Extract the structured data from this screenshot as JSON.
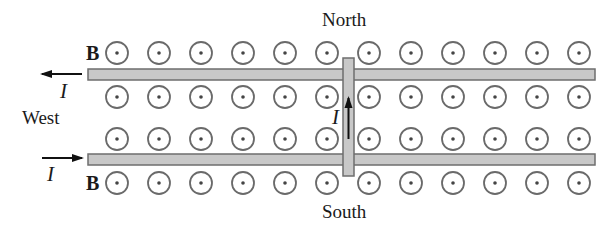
{
  "labels": {
    "north": "North",
    "south": "South",
    "west": "West",
    "field_top": "B",
    "field_bottom": "B",
    "current_top": "I",
    "current_bottom": "I",
    "current_bar": "I"
  },
  "field": {
    "symbol": "out-of-page-dot-circle",
    "columns_x": [
      117,
      159,
      201,
      243,
      285,
      327,
      369,
      411,
      453,
      495,
      537,
      579
    ],
    "rows_y": [
      53,
      97,
      139,
      183
    ],
    "radius": 11
  },
  "rails": [
    {
      "name": "top-rail",
      "x1": 88,
      "x2": 595,
      "y": 69,
      "h": 11,
      "current_direction": "west"
    },
    {
      "name": "bottom-rail",
      "x1": 88,
      "x2": 595,
      "y": 154,
      "h": 11,
      "current_direction": "east"
    }
  ],
  "bar": {
    "x": 343,
    "y": 58,
    "w": 11,
    "h": 118,
    "current_direction": "north"
  },
  "colors": {
    "rail_fill": "#c8c8c8",
    "rail_stroke": "#6e6e6e",
    "circle_stroke": "#6a6a6a",
    "arrow": "#111111"
  }
}
